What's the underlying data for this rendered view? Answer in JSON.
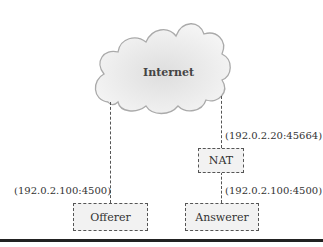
{
  "diagram": {
    "cloud": {
      "label": "Internet"
    },
    "nodes": {
      "nat": {
        "label": "NAT"
      },
      "offerer": {
        "label": "Offerer"
      },
      "answerer": {
        "label": "Answerer"
      }
    },
    "addresses": {
      "nat_public": "(192.0.2.20:45664)",
      "offerer": "(192.0.2.100:4500)",
      "answerer": "(192.0.2.100:4500)"
    }
  }
}
